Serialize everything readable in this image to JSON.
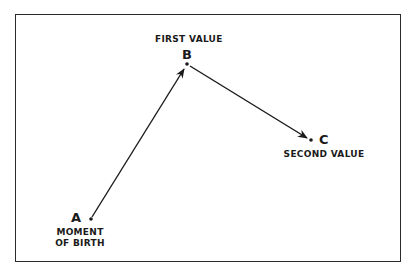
{
  "diagram": {
    "points": [
      {
        "id": "A",
        "letter": "A",
        "label_line1": "MOMENT",
        "label_line2": "OF BIRTH",
        "x": 91,
        "y": 219
      },
      {
        "id": "B",
        "letter": "B",
        "label": "FIRST VALUE",
        "x": 187,
        "y": 64
      },
      {
        "id": "C",
        "letter": "C",
        "label": "SECOND VALUE",
        "x": 311,
        "y": 140
      }
    ],
    "arrows": [
      {
        "from": "A",
        "to": "B"
      },
      {
        "from": "B",
        "to": "C"
      }
    ],
    "colors": {
      "ink": "#1a1a1a",
      "background": "#ffffff"
    }
  }
}
